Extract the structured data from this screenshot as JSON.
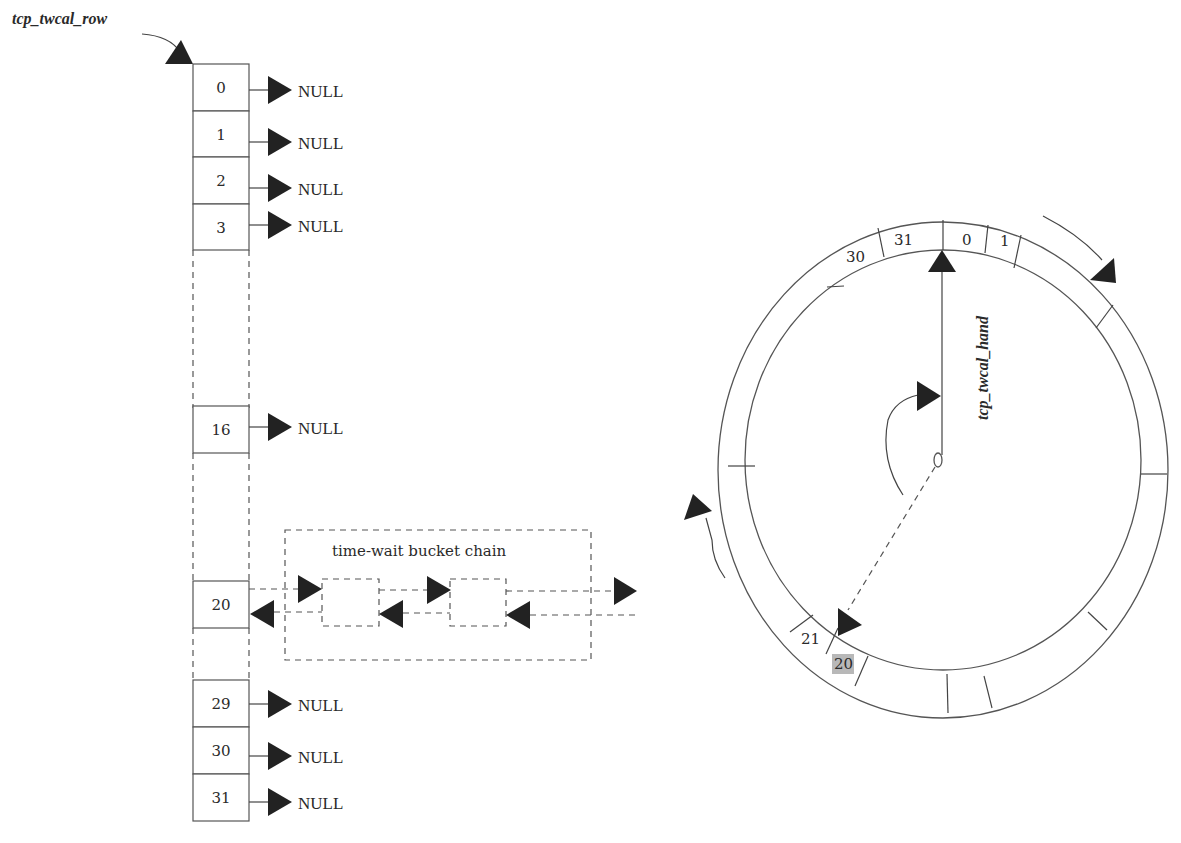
{
  "diagram": {
    "title_label": "tcp_twcal_row",
    "hand_label": "tcp_twcal_hand",
    "chain_label": "time-wait bucket chain",
    "null_label": "NULL",
    "row_slots": [
      {
        "index": "0",
        "target": "NULL"
      },
      {
        "index": "1",
        "target": "NULL"
      },
      {
        "index": "2",
        "target": "NULL"
      },
      {
        "index": "3",
        "target": "NULL"
      },
      {
        "index": "16",
        "target": "NULL"
      },
      {
        "index": "20",
        "target": "time-wait bucket chain"
      },
      {
        "index": "29",
        "target": "NULL"
      },
      {
        "index": "30",
        "target": "NULL"
      },
      {
        "index": "31",
        "target": "NULL"
      }
    ],
    "ring_slots": {
      "s30": "30",
      "s31": "31",
      "s0": "0",
      "s1": "1",
      "s21": "21",
      "s20": "20"
    },
    "highlighted_slot": "20",
    "highlight_color": "#b8b8b8"
  }
}
